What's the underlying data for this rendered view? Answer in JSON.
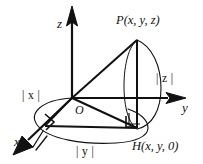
{
  "figure": {
    "stroke_color": "#111111",
    "background_color": "#ffffff",
    "axes": [
      {
        "name": "x-axis",
        "label": "x",
        "direction": "down-left"
      },
      {
        "name": "y-axis",
        "label": "y",
        "direction": "right"
      },
      {
        "name": "z-axis",
        "label": "z",
        "direction": "up"
      }
    ],
    "points": [
      {
        "name": "origin",
        "label": "O"
      },
      {
        "name": "point-p",
        "label": "P(x, y, z)"
      },
      {
        "name": "point-h",
        "label": "H(x, y, 0)"
      }
    ],
    "magnitudes": [
      {
        "name": "abs-x",
        "label": "| x |",
        "bar": "|",
        "variable": "x"
      },
      {
        "name": "abs-y",
        "label": "| y |",
        "bar": "|",
        "variable": "y"
      },
      {
        "name": "abs-z",
        "label": "| z |",
        "bar": "|",
        "variable": "z"
      }
    ],
    "right_angles": [
      {
        "name": "right-angle-at-x-foot"
      },
      {
        "name": "right-angle-at-h"
      }
    ]
  }
}
